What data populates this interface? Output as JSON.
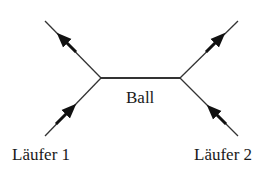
{
  "diagram": {
    "type": "feynman-style interaction diagram",
    "labels": {
      "center": "Ball",
      "left": "Läufer 1",
      "right": "Läufer 2"
    },
    "colors": {
      "line": "#333333",
      "text": "#1a1a1a",
      "background": "#ffffff"
    }
  }
}
